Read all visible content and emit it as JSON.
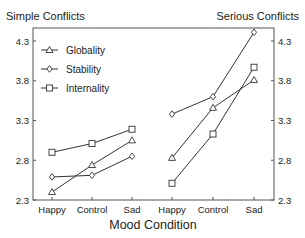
{
  "chart_data": {
    "type": "line",
    "xlabel": "Mood Condition",
    "ylabel": "",
    "ylim": [
      2.3,
      4.4
    ],
    "yticks": [
      2.3,
      2.8,
      3.3,
      3.8,
      4.3
    ],
    "grid": false,
    "legend_position": "upper-left",
    "legend": [
      "Globality",
      "Stability",
      "Internality"
    ],
    "panels": [
      {
        "title": "Simple Conflicts",
        "categories": [
          "Happy",
          "Control",
          "Sad"
        ],
        "series": [
          {
            "name": "Globality",
            "marker": "triangle",
            "values": [
              2.4,
              2.74,
              3.05
            ]
          },
          {
            "name": "Stability",
            "marker": "diamond",
            "values": [
              2.59,
              2.61,
              2.85
            ]
          },
          {
            "name": "Internality",
            "marker": "square",
            "values": [
              2.9,
              3.01,
              3.19
            ]
          }
        ]
      },
      {
        "title": "Serious Conflicts",
        "categories": [
          "Happy",
          "Control",
          "Sad"
        ],
        "series": [
          {
            "name": "Globality",
            "marker": "triangle",
            "values": [
              2.83,
              3.46,
              3.81
            ]
          },
          {
            "name": "Stability",
            "marker": "diamond",
            "values": [
              3.38,
              3.6,
              4.41
            ]
          },
          {
            "name": "Internality",
            "marker": "square",
            "values": [
              2.51,
              3.13,
              3.97
            ]
          }
        ]
      }
    ]
  },
  "titles": {
    "left": "Simple Conflicts",
    "right": "Serious Conflicts"
  },
  "colors": {
    "line": "#333333",
    "axis": "#555555",
    "text": "#222222"
  }
}
